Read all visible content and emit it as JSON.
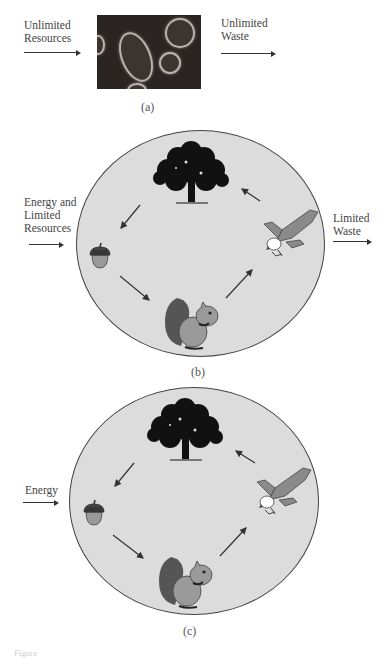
{
  "panel_a": {
    "input_label_line1": "Unlimited",
    "input_label_line2": "Resources",
    "output_label_line1": "Unlimited",
    "output_label_line2": "Waste",
    "image_description": "micrograph-of-bacterial-cells",
    "caption": "(a)"
  },
  "panel_b": {
    "input_label_line1": "Energy and",
    "input_label_line2": "Limited",
    "input_label_line3": "Resources",
    "output_label_line1": "Limited",
    "output_label_line2": "Waste",
    "cycle_nodes": [
      "tree",
      "acorn",
      "squirrel",
      "eagle"
    ],
    "cycle_flow": [
      "tree → acorn",
      "acorn → squirrel",
      "squirrel → eagle",
      "eagle → tree"
    ],
    "caption": "(b)"
  },
  "panel_c": {
    "input_label": "Energy",
    "cycle_nodes": [
      "tree",
      "acorn",
      "squirrel",
      "eagle"
    ],
    "cycle_flow": [
      "tree → acorn",
      "acorn → squirrel",
      "squirrel → eagle",
      "eagle → tree"
    ],
    "caption": "(c)"
  },
  "footer": {
    "figure_label": "Figure"
  },
  "colors": {
    "circle_fill": "#dcdcdc",
    "circle_stroke": "#444444",
    "tree": "#111111",
    "animal_light": "#9a9a9a",
    "animal_dark": "#555555",
    "micrograph_bg": "#2a2523"
  }
}
